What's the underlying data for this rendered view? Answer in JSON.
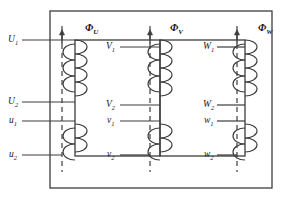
{
  "figure": {
    "kind": "three-phase transformer core winding diagram",
    "background_color": "#ffffff",
    "line_color": "#3c3c3c",
    "text_color": "#1a1a1a"
  },
  "flux_labels": [
    {
      "name": "phi-u",
      "base": "Φ",
      "sub": "U",
      "x": 85,
      "y": 23
    },
    {
      "name": "phi-v",
      "base": "Φ",
      "sub": "V",
      "x": 170,
      "y": 23
    },
    {
      "name": "phi-w",
      "base": "Φ",
      "sub": "W",
      "x": 258,
      "y": 23
    }
  ],
  "flux_arrows": [
    {
      "name": "flux-arrow-u",
      "x": 62,
      "y_top": 30,
      "y_bottom": 44
    },
    {
      "name": "flux-arrow-v",
      "x": 150,
      "y_top": 30,
      "y_bottom": 44
    },
    {
      "name": "flux-arrow-w",
      "x": 237,
      "y_top": 30,
      "y_bottom": 44
    }
  ],
  "limbs": [
    {
      "name": "limb-u",
      "dash_x": 62,
      "coil_x": 75
    },
    {
      "name": "limb-v",
      "dash_x": 150,
      "coil_x": 160
    },
    {
      "name": "limb-w",
      "dash_x": 237,
      "coil_x": 245
    }
  ],
  "terminals": {
    "phase_u": [
      {
        "name": "terminal-U1",
        "base": "U",
        "sub": "1",
        "x": 8,
        "y": 35
      },
      {
        "name": "terminal-U2",
        "base": "U",
        "sub": "2",
        "x": 8,
        "y": 97
      },
      {
        "name": "terminal-u1",
        "base": "u",
        "sub": "1",
        "x": 9,
        "y": 116
      },
      {
        "name": "terminal-u2",
        "base": "u",
        "sub": "2",
        "x": 9,
        "y": 150
      }
    ],
    "phase_v": [
      {
        "name": "terminal-V1",
        "base": "V",
        "sub": "1",
        "x": 106,
        "y": 42
      },
      {
        "name": "terminal-V2",
        "base": "V",
        "sub": "2",
        "x": 106,
        "y": 100
      },
      {
        "name": "terminal-v1",
        "base": "v",
        "sub": "1",
        "x": 107,
        "y": 116
      },
      {
        "name": "terminal-v2",
        "base": "v",
        "sub": "2",
        "x": 107,
        "y": 150
      }
    ],
    "phase_w": [
      {
        "name": "terminal-W1",
        "base": "W",
        "sub": "1",
        "x": 203,
        "y": 42
      },
      {
        "name": "terminal-W2",
        "base": "W",
        "sub": "2",
        "x": 203,
        "y": 100
      },
      {
        "name": "terminal-w1",
        "base": "w",
        "sub": "1",
        "x": 204,
        "y": 116
      },
      {
        "name": "terminal-w2",
        "base": "w",
        "sub": "2",
        "x": 204,
        "y": 150
      }
    ]
  },
  "lead_lines": [
    {
      "name": "lead-U1",
      "x1": 22,
      "x2": 75,
      "y": 40
    },
    {
      "name": "lead-U2",
      "x1": 22,
      "x2": 75,
      "y": 102
    },
    {
      "name": "lead-u1",
      "x1": 22,
      "x2": 75,
      "y": 121
    },
    {
      "name": "lead-u2",
      "x1": 22,
      "x2": 62,
      "y": 155
    },
    {
      "name": "lead-V1",
      "x1": 120,
      "x2": 160,
      "y": 47
    },
    {
      "name": "lead-V2",
      "x1": 120,
      "x2": 160,
      "y": 105
    },
    {
      "name": "lead-v1",
      "x1": 120,
      "x2": 160,
      "y": 121
    },
    {
      "name": "lead-v2",
      "x1": 120,
      "x2": 150,
      "y": 155
    },
    {
      "name": "lead-W1",
      "x1": 217,
      "x2": 245,
      "y": 47
    },
    {
      "name": "lead-W2",
      "x1": 217,
      "x2": 245,
      "y": 105
    },
    {
      "name": "lead-w1",
      "x1": 217,
      "x2": 245,
      "y": 121
    },
    {
      "name": "lead-w2",
      "x1": 217,
      "x2": 237,
      "y": 155
    }
  ],
  "core": {
    "outer_frame": {
      "name": "core-outer-yoke",
      "x": 50,
      "y": 11,
      "w": 222,
      "h": 177
    },
    "windows": [
      {
        "name": "core-window-left",
        "x": 75,
        "y": 40,
        "w": 85,
        "h": 116
      },
      {
        "name": "core-window-right",
        "x": 160,
        "y": 40,
        "w": 85,
        "h": 116
      }
    ]
  }
}
